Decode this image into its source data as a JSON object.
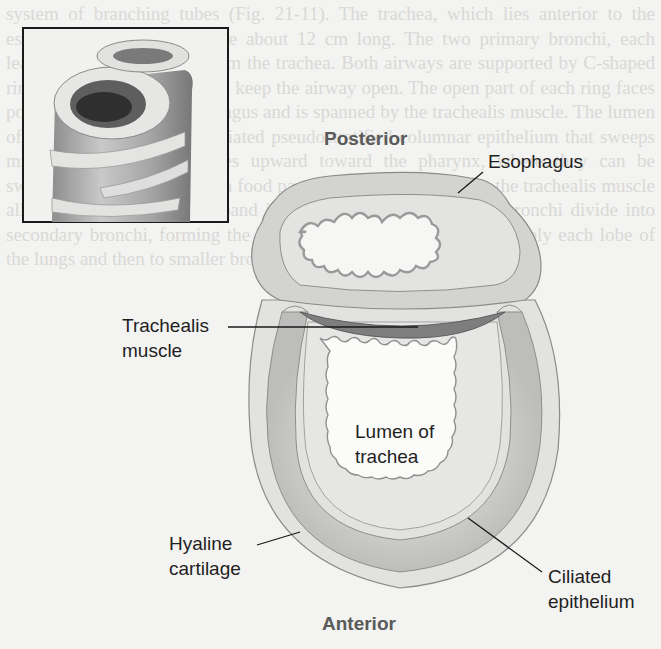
{
  "figure": {
    "inset": {
      "name": "tracheal-segment-3d-inset",
      "description": "3D cutaway of trachea segment showing C-shaped cartilage rings and esophagus"
    },
    "orientation": {
      "top": "Posterior",
      "bottom": "Anterior"
    },
    "labels": {
      "esophagus": "Esophagus",
      "trachealis_line1": "Trachealis",
      "trachealis_line2": "muscle",
      "lumen_line1": "Lumen of",
      "lumen_line2": "trachea",
      "hyaline_line1": "Hyaline",
      "hyaline_line2": "cartilage",
      "ciliated_line1": "Ciliated",
      "ciliated_line2": "epithelium"
    },
    "colors": {
      "background": "#f3f3f1",
      "tissue_light": "#dcdcda",
      "tissue_mid": "#c4c4c2",
      "muscle_dark": "#7c7c7c",
      "outline": "#8a8a8a",
      "label_text": "#1f1f1f",
      "orientation_text": "#5a5a5a"
    }
  },
  "background_bleed_text": "system of branching tubes (Fig. 21-11). The trachea, which lies anterior to the esophagus, is a flexible tube about 12 cm long. The two primary bronchi, each leading to a lung, branch from the trachea. Both airways are supported by C-shaped rings of hyaline cartilage that keep the airway open. The open part of each ring faces posteriorly toward the esophagus and is spanned by the trachealis muscle. The lumen of the trachea is lined by ciliated pseudostratified columnar epithelium that sweeps mucus and trapped particles upward toward the pharynx, where they can be swallowed or expelled. When food passes down the esophagus, the trachealis muscle allows the esophagus to expand into the trachea. The primary bronchi divide into secondary bronchi, forming the bronchial tree that branches to supply each lobe of the lungs and then to smaller bronchioles and alveolar ducts."
}
